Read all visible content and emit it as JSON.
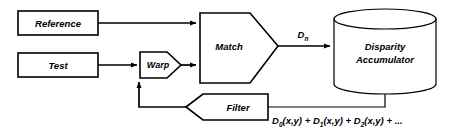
{
  "diagram": {
    "background_color": "#ffffff",
    "stroke_color": "#000000",
    "nodes": {
      "reference": {
        "label": "Reference",
        "shape": "rectangle"
      },
      "test": {
        "label": "Test",
        "shape": "rectangle"
      },
      "warp": {
        "label": "Warp",
        "shape": "pentagon-right"
      },
      "match": {
        "label": "Match",
        "shape": "pentagon-right"
      },
      "accumulator": {
        "label_line1": "Disparity",
        "label_line2": "Accumulator",
        "shape": "cylinder"
      },
      "filter": {
        "label": "Filter",
        "shape": "pentagon-left"
      }
    },
    "edges": {
      "match_to_accumulator": {
        "label_base": "D",
        "label_sub": "n"
      }
    },
    "formula": {
      "term1_base": "D",
      "term1_sub": "0",
      "term1_args": "(x,y)",
      "op1": " + ",
      "term2_base": "D",
      "term2_sub": "1",
      "term2_args": "(x,y)",
      "op2": " + ",
      "term3_base": "D",
      "term3_sub": "2",
      "term3_args": "(x,y)",
      "op3": " + ",
      "ellipsis": "..."
    }
  }
}
